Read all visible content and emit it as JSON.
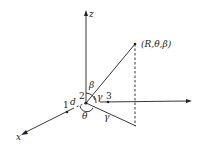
{
  "diagram": {
    "axis_labels": {
      "z": "z",
      "x": "x"
    },
    "point_label": "(R,θ,β)",
    "points": {
      "p1": "1",
      "p2": "2",
      "p3": "3"
    },
    "distance_label": "d",
    "angles": {
      "beta": "β",
      "gamma_upper": "γ",
      "theta": "θ",
      "gamma_lower": "γ"
    },
    "colors": {
      "line": "#222222",
      "background": "#ffffff"
    }
  }
}
